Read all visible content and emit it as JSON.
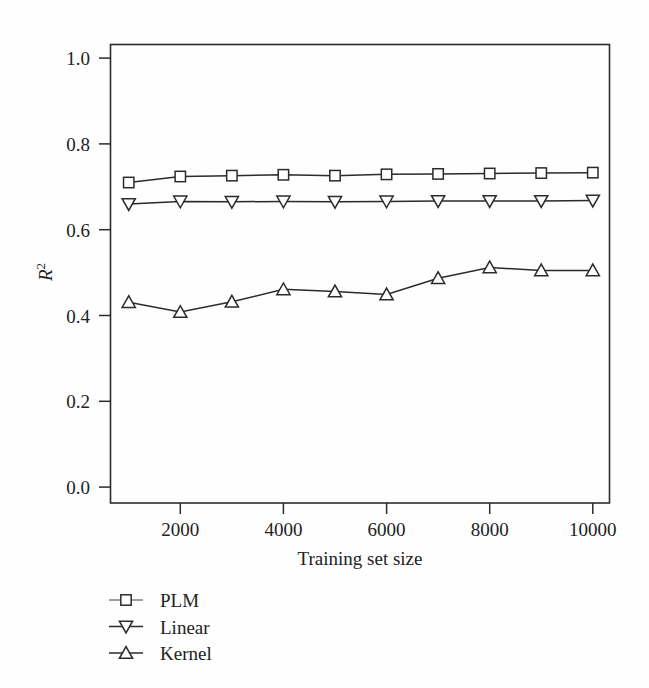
{
  "figure": {
    "background_color": "#fefefe",
    "ink_color": "#2b2b2b"
  },
  "chart_data": {
    "type": "line",
    "title": "",
    "xlabel": "Training set size",
    "ylabel": "R2",
    "ylabel_display": "R",
    "ylabel_superscript": "2",
    "x": [
      1000,
      2000,
      3000,
      4000,
      5000,
      6000,
      7000,
      8000,
      9000,
      10000
    ],
    "xlim": [
      600,
      10700
    ],
    "ylim": [
      0.0,
      1.035
    ],
    "xticks": [
      2000,
      4000,
      6000,
      8000,
      10000
    ],
    "xticklabels": [
      "2000",
      "4000",
      "6000",
      "8000",
      "10000"
    ],
    "yticks": [
      0.0,
      0.2,
      0.4,
      0.6,
      0.8,
      1.0
    ],
    "yticklabels": [
      "0.0",
      "0.2",
      "0.4",
      "0.6",
      "0.8",
      "1.0"
    ],
    "grid": false,
    "legend_position": "below-left",
    "series": [
      {
        "name": "PLM",
        "marker": "square-open",
        "values": [
          0.71,
          0.724,
          0.726,
          0.728,
          0.726,
          0.729,
          0.73,
          0.731,
          0.732,
          0.733
        ]
      },
      {
        "name": "Linear",
        "marker": "triangle-down-open",
        "values": [
          0.66,
          0.666,
          0.665,
          0.666,
          0.665,
          0.666,
          0.667,
          0.667,
          0.667,
          0.668
        ]
      },
      {
        "name": "Kernel",
        "marker": "triangle-up-open",
        "values": [
          0.431,
          0.408,
          0.432,
          0.461,
          0.456,
          0.449,
          0.487,
          0.512,
          0.505,
          0.505
        ]
      }
    ]
  },
  "legend": {
    "items": [
      {
        "label": "PLM",
        "marker": "square-open"
      },
      {
        "label": "Linear",
        "marker": "triangle-down-open"
      },
      {
        "label": "Kernel",
        "marker": "triangle-up-open"
      }
    ]
  },
  "caption": {
    "text": ""
  }
}
